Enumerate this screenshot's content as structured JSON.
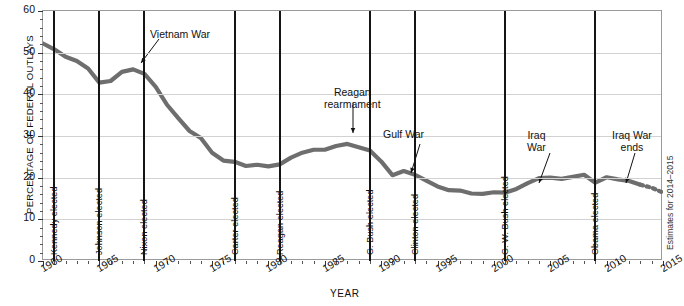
{
  "chart_data": {
    "type": "line",
    "title": "",
    "xlabel": "YEAR",
    "ylabel": "PERCENTAGE OF FEDERAL OUTLAYS",
    "xlim": [
      1960,
      2015
    ],
    "ylim": [
      0,
      60
    ],
    "ytick_labels": [
      "0",
      "10",
      "20",
      "30",
      "40",
      "50",
      "60"
    ],
    "ytick_values": [
      0,
      10,
      20,
      30,
      40,
      50,
      60
    ],
    "xtick_labels": [
      "1960",
      "1965",
      "1970",
      "1975",
      "1980",
      "1985",
      "1990",
      "1995",
      "2000",
      "2005",
      "2010",
      "2015"
    ],
    "xtick_values": [
      1960,
      1965,
      1970,
      1975,
      1980,
      1985,
      1990,
      1995,
      2000,
      2005,
      2010,
      2015
    ],
    "grid": "horizontal",
    "legend": "none",
    "series": [
      {
        "name": "Defense share of federal outlays",
        "x": [
          1960,
          1961,
          1962,
          1963,
          1964,
          1965,
          1966,
          1967,
          1968,
          1969,
          1970,
          1971,
          1972,
          1973,
          1974,
          1975,
          1976,
          1977,
          1978,
          1979,
          1980,
          1981,
          1982,
          1983,
          1984,
          1985,
          1986,
          1987,
          1988,
          1989,
          1990,
          1991,
          1992,
          1993,
          1994,
          1995,
          1996,
          1997,
          1998,
          1999,
          2000,
          2001,
          2002,
          2003,
          2004,
          2005,
          2006,
          2007,
          2008,
          2009,
          2010,
          2011,
          2012,
          2013,
          2014,
          2015
        ],
        "y": [
          52.2,
          50.8,
          49.0,
          48.0,
          46.2,
          42.8,
          43.2,
          45.4,
          46.0,
          44.9,
          41.8,
          37.5,
          34.3,
          31.2,
          29.5,
          26.0,
          24.1,
          23.8,
          22.8,
          23.1,
          22.7,
          23.2,
          24.8,
          26.0,
          26.7,
          26.7,
          27.6,
          28.1,
          27.3,
          26.5,
          23.9,
          20.6,
          21.6,
          20.7,
          19.3,
          17.9,
          17.0,
          16.9,
          16.2,
          16.1,
          16.5,
          16.4,
          17.3,
          18.7,
          19.9,
          20.0,
          19.7,
          20.2,
          20.7,
          18.8,
          20.1,
          19.6,
          19.2,
          18.3,
          17.6,
          16.4
        ]
      }
    ],
    "estimates_note": "Estimates for 2014–2015",
    "annotations": [
      {
        "text": "Vietnam War",
        "x": 1968
      },
      {
        "text": "Reagan\nrearmament",
        "x": 1987
      },
      {
        "text": "Gulf War",
        "x": 1992
      },
      {
        "text": "Iraq\nWar",
        "x": 2003
      },
      {
        "text": "Iraq War\nends",
        "x": 2011
      }
    ],
    "event_lines": [
      {
        "label": "Kennedy elected",
        "year": 1961
      },
      {
        "label": "Johnson elected",
        "year": 1965
      },
      {
        "label": "Nixon elected",
        "year": 1969
      },
      {
        "label": "Carter elected",
        "year": 1977
      },
      {
        "label": "Reagan elected",
        "year": 1981
      },
      {
        "label": "G. Bush elected",
        "year": 1989
      },
      {
        "label": "Clinton elected",
        "year": 1993
      },
      {
        "label": "G. W. Bush elected",
        "year": 2001
      },
      {
        "label": "Obama elected",
        "year": 2009
      }
    ],
    "colors": {
      "series": "#6e6e6e",
      "event_line": "#151515",
      "grid": "#d2d2d2",
      "frame": "#9a9a9a",
      "text": "#111111"
    }
  }
}
